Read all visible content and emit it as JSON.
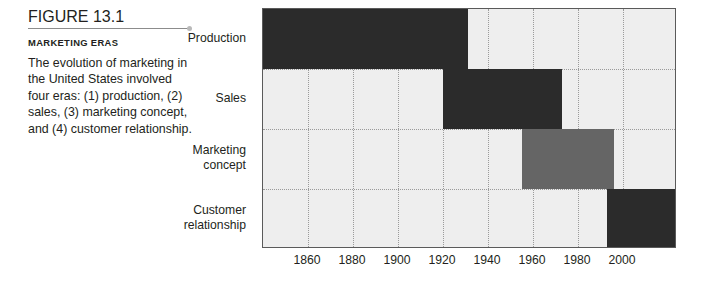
{
  "caption": {
    "figure_number": "FIGURE 13.1",
    "kicker": "MARKETING ERAS",
    "body": "The evolution of marketing in the United States involved four eras: (1) production, (2) sales, (3) marketing concept, and (4) customer relationship."
  },
  "colors": {
    "bar_dark": "#2b2b2b",
    "bar_gray": "#656565",
    "plot_background": "#eeeeee",
    "plot_border": "#5a5a5a",
    "gridline": "#9a9a9a",
    "text": "#231f20",
    "divider": "#8c8c8c",
    "divider_dot": "#b9b9b9"
  },
  "chart_data": {
    "type": "bar",
    "orientation": "horizontal",
    "title": "",
    "subtitle": "",
    "xlabel": "",
    "ylabel": "",
    "xlim": [
      1840,
      2024
    ],
    "grid": true,
    "legend": false,
    "xticks": [
      1860,
      1880,
      1900,
      1920,
      1940,
      1960,
      1980,
      2000
    ],
    "xtick_labels": [
      "1860",
      "1880",
      "1900",
      "1920",
      "1940",
      "1960",
      "1980",
      "2000"
    ],
    "categories": [
      "Production",
      "Sales",
      "Marketing concept",
      "Customer relationship"
    ],
    "category_labels": [
      "Production",
      "Sales",
      "Marketing\nconcept",
      "Customer\nrelationship"
    ],
    "bars": [
      {
        "category": "Production",
        "start": 1840,
        "end": 1931,
        "color": "#2b2b2b"
      },
      {
        "category": "Sales",
        "start": 1920,
        "end": 1973,
        "color": "#2b2b2b"
      },
      {
        "category": "Marketing concept",
        "start": 1955,
        "end": 1996,
        "color": "#656565"
      },
      {
        "category": "Customer relationship",
        "start": 1993,
        "end": 2024,
        "color": "#2b2b2b"
      }
    ]
  }
}
